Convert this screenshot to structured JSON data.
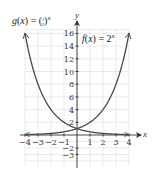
{
  "chart_data": {
    "type": "line",
    "title": "",
    "xlabel": "x",
    "ylabel": "y",
    "xlim": [
      -4,
      4
    ],
    "ylim": [
      -3,
      16
    ],
    "grid": true,
    "x_ticks": [
      -4,
      -3,
      -2,
      -1,
      1,
      2,
      3,
      4
    ],
    "x_tick_labels": [
      "−4",
      "−3",
      "−2",
      "−1",
      "1",
      "2",
      "3",
      "4"
    ],
    "y_ticks": [
      16,
      14,
      12,
      10,
      8,
      6,
      4,
      2,
      -2,
      -3
    ],
    "y_tick_labels": [
      "16",
      "14",
      "12",
      "10",
      "8",
      "6",
      "4",
      "2",
      "−2",
      "−3"
    ],
    "series": [
      {
        "name": "f(x) = 2^x",
        "label_parts": [
          "f",
          "(",
          "x",
          ") = 2",
          "x"
        ],
        "x": [
          -4,
          -3,
          -2,
          -1,
          0,
          1,
          2,
          3,
          4
        ],
        "values": [
          0.0625,
          0.125,
          0.25,
          0.5,
          1,
          2,
          4,
          8,
          16
        ]
      },
      {
        "name": "g(x) = (1/2)^x",
        "label_parts": [
          "g",
          "(",
          "x",
          ") = (",
          "1",
          "2",
          ")",
          "x"
        ],
        "x": [
          -4,
          -3,
          -2,
          -1,
          0,
          1,
          2,
          3,
          4
        ],
        "values": [
          16,
          8,
          4,
          2,
          1,
          0.5,
          0.25,
          0.125,
          0.0625
        ]
      }
    ],
    "annotations": [
      "Curves intersect at (0, 1)"
    ]
  },
  "colors": {
    "curve": "#4a4a4a",
    "grid": "#dcdcdc",
    "axis": "#333333"
  }
}
